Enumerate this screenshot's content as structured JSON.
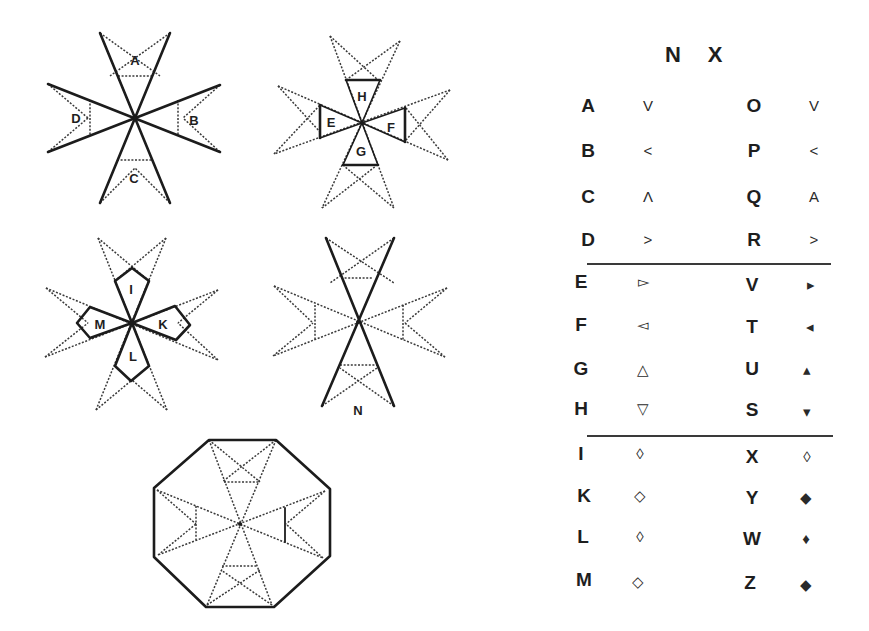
{
  "figures": {
    "cross_abcd": {
      "labels": [
        "A",
        "B",
        "C",
        "D"
      ]
    },
    "cross_efgh": {
      "labels": [
        "H",
        "E",
        "F",
        "G"
      ]
    },
    "cross_iklm": {
      "labels": [
        "I",
        "M",
        "K",
        "L"
      ]
    },
    "cross_n": {
      "label": "N"
    },
    "octagon": {}
  },
  "table": {
    "header": [
      "N",
      "X"
    ],
    "groups": [
      {
        "rows": [
          {
            "left": "A",
            "left_sym": "V",
            "right": "O",
            "right_sym": "V"
          },
          {
            "left": "B",
            "left_sym": "<",
            "right": "P",
            "right_sym": "<"
          },
          {
            "left": "C",
            "left_sym": "Λ",
            "right": "Q",
            "right_sym": "A"
          },
          {
            "left": "D",
            "left_sym": ">",
            "right": "R",
            "right_sym": ">"
          }
        ]
      },
      {
        "rows": [
          {
            "left": "E",
            "left_sym": "▻",
            "right": "V",
            "right_sym": "▸"
          },
          {
            "left": "F",
            "left_sym": "◅",
            "right": "T",
            "right_sym": "◂"
          },
          {
            "left": "G",
            "left_sym": "△",
            "right": "U",
            "right_sym": "▴"
          },
          {
            "left": "H",
            "left_sym": "▽",
            "right": "S",
            "right_sym": "▾"
          }
        ]
      },
      {
        "rows": [
          {
            "left": "I",
            "left_sym": "◊",
            "right": "X",
            "right_sym": "◊"
          },
          {
            "left": "K",
            "left_sym": "◇",
            "right": "Y",
            "right_sym": "◆"
          },
          {
            "left": "L",
            "left_sym": "◊",
            "right": "W",
            "right_sym": "♦"
          },
          {
            "left": "M",
            "left_sym": "◇",
            "right": "Z",
            "right_sym": "◆"
          }
        ]
      }
    ]
  }
}
